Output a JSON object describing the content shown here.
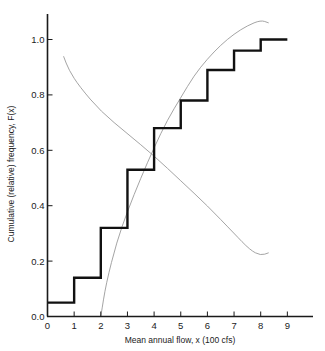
{
  "chart_data": {
    "type": "line",
    "title": "",
    "xlabel": "Mean annual flow, x (100 cfs)",
    "ylabel": "Cumulative (relative) frequency, F(x)",
    "xlim": [
      0,
      9
    ],
    "ylim": [
      0.0,
      1.0
    ],
    "grid": false,
    "legend": null,
    "x_ticks": [
      "0",
      "1",
      "2",
      "3",
      "4",
      "5",
      "6",
      "7",
      "8",
      "9"
    ],
    "y_ticks": [
      "0.0",
      "0.2",
      "0.4",
      "0.6",
      "0.8",
      "1.0"
    ],
    "series": [
      {
        "name": "Empirical cumulative frequency (step)",
        "style": "step, thick black",
        "bins": [
          [
            0,
            1
          ],
          [
            1,
            2
          ],
          [
            2,
            3
          ],
          [
            3,
            4
          ],
          [
            4,
            5
          ],
          [
            5,
            6
          ],
          [
            6,
            7
          ],
          [
            7,
            8
          ],
          [
            8,
            9
          ]
        ],
        "values": [
          0.05,
          0.14,
          0.32,
          0.53,
          0.68,
          0.78,
          0.89,
          0.96,
          1.0
        ]
      },
      {
        "name": "Increasing thin curve",
        "style": "thin gray",
        "x": [
          2.0,
          2.2,
          2.6,
          3.0,
          3.5,
          4.0,
          4.5,
          5.0,
          5.5,
          6.0,
          6.5,
          7.0,
          7.5,
          8.0,
          8.3
        ],
        "y": [
          0.0,
          0.12,
          0.27,
          0.38,
          0.5,
          0.61,
          0.71,
          0.79,
          0.87,
          0.93,
          0.98,
          1.02,
          1.05,
          1.07,
          1.06
        ]
      },
      {
        "name": "Decreasing thin curve",
        "style": "thin gray",
        "x": [
          0.6,
          0.8,
          1.2,
          2.0,
          3.0,
          4.0,
          5.0,
          6.0,
          7.0,
          7.6,
          8.0,
          8.3
        ],
        "y": [
          0.94,
          0.89,
          0.83,
          0.74,
          0.66,
          0.58,
          0.49,
          0.4,
          0.3,
          0.24,
          0.22,
          0.23
        ]
      }
    ]
  },
  "axes": {
    "x_title": "Mean annual flow, x (100 cfs)",
    "y_title": "Cumulative (relative) frequency, F(x)"
  }
}
